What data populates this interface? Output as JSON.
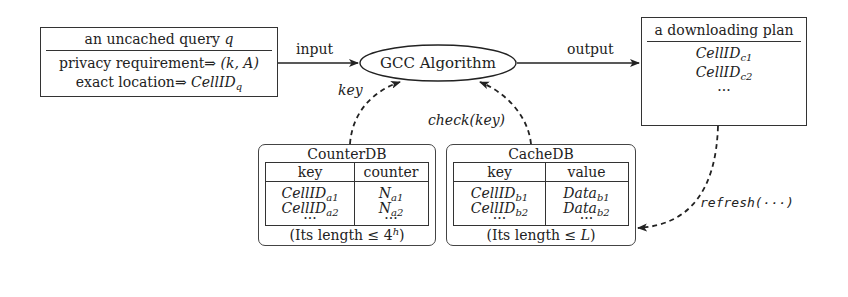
{
  "query_box": {
    "title_prefix": "an uncached query ",
    "title_var": "q",
    "line1_prefix": "privacy requirement⇒ ",
    "line1_value": "(k, A)",
    "line2_prefix": "exact location⇒ ",
    "line2_var": "CellID",
    "line2_sub": "q"
  },
  "edges": {
    "input_label": "input",
    "output_label": "output",
    "key_label": "key",
    "check_label": "check(key)",
    "refresh_label": "refresh(···)"
  },
  "algorithm": {
    "label": "GCC Algorithm"
  },
  "plan_box": {
    "title": "a downloading plan",
    "items": [
      {
        "var": "CellID",
        "sub": "c1"
      },
      {
        "var": "CellID",
        "sub": "c2"
      }
    ],
    "ellipsis": "···"
  },
  "counter_db": {
    "title": "CounterDB",
    "columns": [
      "key",
      "counter"
    ],
    "rows": [
      {
        "key": "CellID",
        "key_sub": "a1",
        "val": "N",
        "val_sub": "a1"
      },
      {
        "key": "CellID",
        "key_sub": "a2",
        "val": "N",
        "val_sub": "a2"
      }
    ],
    "ellipsis": "···",
    "footer_prefix": "(Its length ≤ 4",
    "footer_sup": "h",
    "footer_suffix": ")"
  },
  "cache_db": {
    "title": "CacheDB",
    "columns": [
      "key",
      "value"
    ],
    "rows": [
      {
        "key": "CellID",
        "key_sub": "b1",
        "val": "Data",
        "val_sub": "b1"
      },
      {
        "key": "CellID",
        "key_sub": "b2",
        "val": "Data",
        "val_sub": "b2"
      }
    ],
    "ellipsis": "···",
    "footer_prefix": "(Its length ≤ ",
    "footer_var": "L",
    "footer_suffix": ")"
  }
}
